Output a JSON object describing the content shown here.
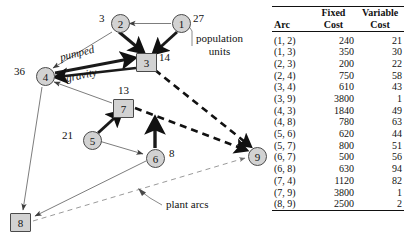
{
  "figure": {
    "graph": {
      "nodes": [
        {
          "id": "1",
          "label": "1",
          "shape": "circle",
          "x": 172,
          "y": 14,
          "supply": "27",
          "supply_side": "right"
        },
        {
          "id": "2",
          "label": "2",
          "shape": "circle",
          "x": 111,
          "y": 14,
          "supply": "3",
          "supply_side": "left"
        },
        {
          "id": "3",
          "label": "3",
          "shape": "square",
          "x": 136,
          "y": 53,
          "supply": "14",
          "supply_side": "right"
        },
        {
          "id": "4",
          "label": "4",
          "shape": "circle",
          "x": 36,
          "y": 67,
          "supply": "36",
          "supply_side": "left"
        },
        {
          "id": "5",
          "label": "5",
          "shape": "circle",
          "x": 83,
          "y": 131,
          "supply": "21",
          "supply_side": "left"
        },
        {
          "id": "6",
          "label": "6",
          "shape": "circle",
          "x": 146,
          "y": 149,
          "supply": "8",
          "supply_side": "right"
        },
        {
          "id": "7",
          "label": "7",
          "shape": "square",
          "x": 113,
          "y": 99,
          "supply": "13",
          "supply_side": "top"
        },
        {
          "id": "8",
          "label": "8",
          "shape": "square",
          "x": 10,
          "y": 213,
          "supply": "",
          "supply_side": "none"
        },
        {
          "id": "9",
          "label": "9",
          "shape": "circle",
          "x": 248,
          "y": 147,
          "supply": "",
          "supply_side": "none"
        }
      ],
      "arc_labels": [
        {
          "text": "pumped",
          "x": 60,
          "y": 57,
          "rotate": -14
        },
        {
          "text": "gravity",
          "x": 66,
          "y": 76,
          "rotate": -13
        }
      ],
      "annotations": [
        {
          "name": "population-units",
          "line1": "population",
          "line2": "units",
          "x": 196,
          "y": 32
        },
        {
          "name": "plant-arcs",
          "line1": "plant arcs",
          "line2": "",
          "x": 166,
          "y": 201
        }
      ]
    },
    "table": {
      "headers": {
        "arc": "Arc",
        "fixed_line1": "Fixed",
        "fixed_line2": "Cost",
        "variable_line1": "Variable",
        "variable_line2": "Cost"
      },
      "rows": [
        {
          "arc": "(1, 2)",
          "fixed": "240",
          "variable": "21"
        },
        {
          "arc": "(1, 3)",
          "fixed": "350",
          "variable": "30"
        },
        {
          "arc": "(2, 3)",
          "fixed": "200",
          "variable": "22"
        },
        {
          "arc": "(2, 4)",
          "fixed": "750",
          "variable": "58"
        },
        {
          "arc": "(3, 4)",
          "fixed": "610",
          "variable": "43"
        },
        {
          "arc": "(3, 9)",
          "fixed": "3800",
          "variable": "1"
        },
        {
          "arc": "(4, 3)",
          "fixed": "1840",
          "variable": "49"
        },
        {
          "arc": "(4, 8)",
          "fixed": "780",
          "variable": "63"
        },
        {
          "arc": "(5, 6)",
          "fixed": "620",
          "variable": "44"
        },
        {
          "arc": "(5, 7)",
          "fixed": "800",
          "variable": "51"
        },
        {
          "arc": "(6, 7)",
          "fixed": "500",
          "variable": "56"
        },
        {
          "arc": "(6, 8)",
          "fixed": "630",
          "variable": "94"
        },
        {
          "arc": "(7, 4)",
          "fixed": "1120",
          "variable": "82"
        },
        {
          "arc": "(7, 9)",
          "fixed": "3800",
          "variable": "1"
        },
        {
          "arc": "(8, 9)",
          "fixed": "2500",
          "variable": "2"
        }
      ]
    }
  },
  "colors": {
    "node_fill": "#d2d2d2",
    "node_stroke": "#4a4a4a",
    "arc_thin": "#6e6e6e",
    "arc_thick": "#1a1a1a",
    "text": "#111111"
  }
}
